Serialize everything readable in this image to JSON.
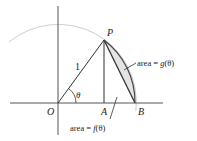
{
  "figure": {
    "points": {
      "O": {
        "label": "O",
        "x": 58,
        "y": 103
      },
      "P": {
        "label": "P",
        "x": 104,
        "y": 40
      },
      "A": {
        "label": "A",
        "x": 104,
        "y": 103
      },
      "B": {
        "label": "B",
        "x": 135,
        "y": 103
      }
    },
    "radius_label": "1",
    "angle_label": "θ",
    "annotations": {
      "g_area": {
        "prefix": "area = ",
        "func": "g",
        "arg": "(θ)"
      },
      "f_area": {
        "prefix": "area = ",
        "func": "f",
        "arg": "(θ)"
      }
    },
    "colors": {
      "axis": "#555555",
      "lines": "#333333",
      "circle": "#cfcfcf",
      "segment_fill": "#e4e4e4"
    }
  }
}
